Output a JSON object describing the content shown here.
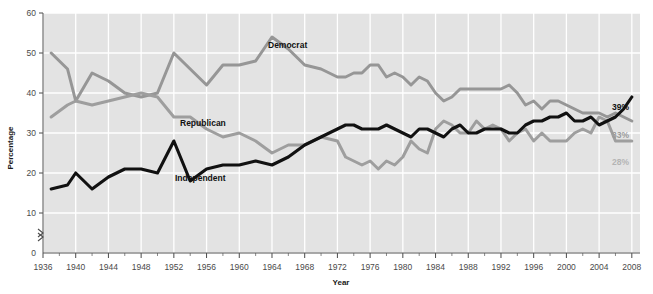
{
  "chart_data": {
    "type": "line",
    "title": "",
    "xlabel": "Year",
    "ylabel": "Percentage",
    "xlim": [
      1936,
      2009
    ],
    "ylim": [
      0,
      60
    ],
    "ytick_labels": [
      "0",
      "10",
      "20",
      "30",
      "40",
      "50",
      "60"
    ],
    "yticks": [
      0,
      10,
      20,
      30,
      40,
      50,
      60
    ],
    "y_axis_break": true,
    "grid": "white gridlines on light gray panel",
    "legend_position": "inline labels on lines",
    "xtick_labels": [
      "1936",
      "1940",
      "1944",
      "1948",
      "1952",
      "1956",
      "1960",
      "1964",
      "1968",
      "1972",
      "1976",
      "1980",
      "1984",
      "1988",
      "1992",
      "1996",
      "2000",
      "2004",
      "2008"
    ],
    "xticks": [
      1936,
      1940,
      1944,
      1948,
      1952,
      1956,
      1960,
      1964,
      1968,
      1972,
      1976,
      1980,
      1984,
      1988,
      1992,
      1996,
      2000,
      2004,
      2008
    ],
    "series": [
      {
        "name": "Democrat",
        "color": "#969696",
        "label_text": "Democrat",
        "end_label": "33%",
        "end_value": 33,
        "x": [
          1937,
          1939,
          1940,
          1942,
          1944,
          1946,
          1948,
          1950,
          1952,
          1954,
          1956,
          1958,
          1960,
          1962,
          1964,
          1966,
          1968,
          1970,
          1972,
          1973,
          1974,
          1975,
          1976,
          1977,
          1978,
          1979,
          1980,
          1981,
          1982,
          1983,
          1984,
          1985,
          1986,
          1987,
          1988,
          1989,
          1990,
          1991,
          1992,
          1993,
          1994,
          1995,
          1996,
          1997,
          1998,
          1999,
          2000,
          2001,
          2002,
          2003,
          2004,
          2005,
          2006,
          2007,
          2008
        ],
        "values": [
          50,
          46,
          38,
          45,
          43,
          40,
          39,
          40,
          50,
          46,
          42,
          47,
          47,
          48,
          54,
          51,
          47,
          46,
          44,
          44,
          45,
          45,
          47,
          47,
          44,
          45,
          44,
          42,
          44,
          43,
          40,
          38,
          39,
          41,
          41,
          41,
          41,
          41,
          41,
          42,
          40,
          37,
          38,
          36,
          38,
          38,
          37,
          36,
          35,
          35,
          35,
          34,
          35,
          34,
          33
        ]
      },
      {
        "name": "Republican",
        "color": "#9e9e9e",
        "label_text": "Republican",
        "end_label": "28%",
        "end_value": 28,
        "x": [
          1937,
          1939,
          1940,
          1942,
          1944,
          1946,
          1948,
          1950,
          1952,
          1954,
          1956,
          1958,
          1960,
          1962,
          1964,
          1966,
          1968,
          1970,
          1972,
          1973,
          1974,
          1975,
          1976,
          1977,
          1978,
          1979,
          1980,
          1981,
          1982,
          1983,
          1984,
          1985,
          1986,
          1987,
          1988,
          1989,
          1990,
          1991,
          1992,
          1993,
          1994,
          1995,
          1996,
          1997,
          1998,
          1999,
          2000,
          2001,
          2002,
          2003,
          2004,
          2005,
          2006,
          2007,
          2008
        ],
        "values": [
          34,
          37,
          38,
          37,
          38,
          39,
          40,
          39,
          34,
          34,
          31,
          29,
          30,
          28,
          25,
          27,
          27,
          29,
          28,
          24,
          23,
          22,
          23,
          21,
          23,
          22,
          24,
          28,
          26,
          25,
          31,
          33,
          32,
          30,
          30,
          33,
          31,
          32,
          31,
          28,
          30,
          31,
          28,
          30,
          28,
          28,
          28,
          30,
          31,
          30,
          34,
          33,
          28,
          28,
          28
        ]
      },
      {
        "name": "Independent",
        "color": "#111111",
        "label_text": "Independent",
        "end_label": "39%",
        "end_value": 39,
        "x": [
          1937,
          1939,
          1940,
          1942,
          1944,
          1946,
          1948,
          1950,
          1952,
          1954,
          1956,
          1958,
          1960,
          1962,
          1964,
          1966,
          1968,
          1970,
          1972,
          1973,
          1974,
          1975,
          1976,
          1977,
          1978,
          1979,
          1980,
          1981,
          1982,
          1983,
          1984,
          1985,
          1986,
          1987,
          1988,
          1989,
          1990,
          1991,
          1992,
          1993,
          1994,
          1995,
          1996,
          1997,
          1998,
          1999,
          2000,
          2001,
          2002,
          2003,
          2004,
          2005,
          2006,
          2007,
          2008
        ],
        "values": [
          16,
          17,
          20,
          16,
          19,
          21,
          21,
          20,
          28,
          18,
          21,
          22,
          22,
          23,
          22,
          24,
          27,
          29,
          31,
          32,
          32,
          31,
          31,
          31,
          32,
          31,
          30,
          29,
          31,
          31,
          30,
          29,
          31,
          32,
          30,
          30,
          31,
          31,
          31,
          30,
          30,
          32,
          33,
          33,
          34,
          34,
          35,
          33,
          33,
          34,
          32,
          33,
          34,
          36,
          39
        ]
      }
    ]
  },
  "axis": {
    "ylabel": "Percentage",
    "xlabel": "Year"
  }
}
